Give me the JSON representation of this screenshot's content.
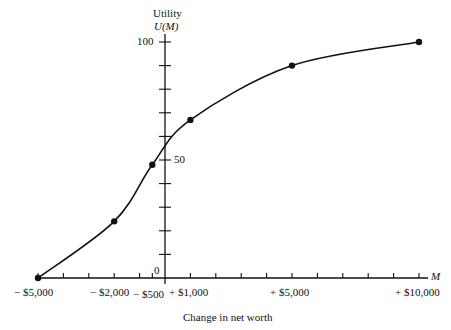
{
  "chart_data": {
    "type": "line",
    "title": "",
    "ylabel_line1": "Utility",
    "ylabel_line2": "U(M)",
    "xlabel": "Change in net worth",
    "x_axis_symbol": "M",
    "x": [
      -5000,
      -2000,
      -500,
      1000,
      5000,
      10000
    ],
    "series": [
      {
        "name": "U(M)",
        "values": [
          0,
          24,
          48,
          67,
          90,
          100
        ]
      }
    ],
    "x_tick_labels": [
      "− $5,000",
      "− $2,000",
      "− $500",
      "+ $1,000",
      "+ $5,000",
      "+ $10,000"
    ],
    "y_tick_labels": [
      "0",
      "50",
      "100"
    ],
    "xlim": [
      -5000,
      10000
    ],
    "ylim": [
      0,
      100
    ],
    "x_minor_tick_step": 1000,
    "y_minor_tick_step": 10,
    "grid": false,
    "legend": "none"
  }
}
